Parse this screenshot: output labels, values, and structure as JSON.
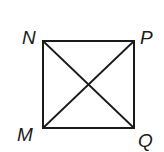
{
  "diagram": {
    "type": "square-with-diagonals",
    "stroke_color": "#1a1a1a",
    "background": "#ffffff",
    "vertices": [
      {
        "label": "N",
        "x": 43,
        "y": 41,
        "label_x": 22,
        "label_y": 44
      },
      {
        "label": "P",
        "x": 134,
        "y": 41,
        "label_x": 140,
        "label_y": 44
      },
      {
        "label": "M",
        "x": 43,
        "y": 128,
        "label_x": 17,
        "label_y": 141
      },
      {
        "label": "Q",
        "x": 134,
        "y": 128,
        "label_x": 138,
        "label_y": 147
      }
    ],
    "diagonals": [
      [
        "N",
        "Q"
      ],
      [
        "P",
        "M"
      ]
    ]
  }
}
